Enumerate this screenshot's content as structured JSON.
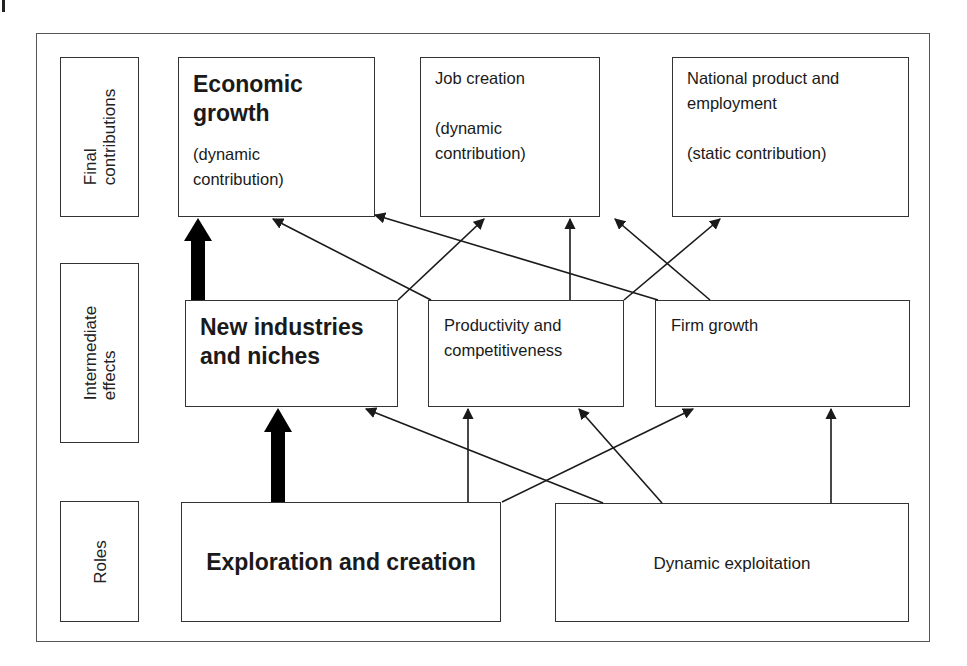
{
  "diagram": {
    "row_labels": {
      "final": [
        "Final",
        "contributions"
      ],
      "intermediate": [
        "Intermediate",
        "effects"
      ],
      "roles": [
        "Roles"
      ]
    },
    "final_contributions": {
      "economic_growth": {
        "title_line1": "Economic",
        "title_line2": "growth",
        "sub_line1": "(dynamic",
        "sub_line2": "contribution)"
      },
      "job_creation": {
        "title": "Job creation",
        "sub_line1": "(dynamic",
        "sub_line2": "contribution)"
      },
      "national_product": {
        "title_line1": "National product and",
        "title_line2": "employment",
        "sub": "(static contribution)"
      }
    },
    "intermediate_effects": {
      "new_industries": {
        "line1": "New industries",
        "line2": "and niches"
      },
      "productivity": {
        "line1": "Productivity and",
        "line2": "competitiveness"
      },
      "firm_growth": {
        "title": "Firm growth"
      }
    },
    "roles": {
      "exploration": {
        "title": "Exploration and creation"
      },
      "exploitation": {
        "title": "Dynamic exploitation"
      }
    },
    "edges": [
      {
        "from": "Exploration and creation",
        "to": "New industries and niches",
        "style": "thick"
      },
      {
        "from": "New industries and niches",
        "to": "Economic growth",
        "style": "thick"
      },
      {
        "from": "Exploration and creation",
        "to": "Productivity and competitiveness",
        "style": "thin"
      },
      {
        "from": "Exploration and creation",
        "to": "Firm growth",
        "style": "thin"
      },
      {
        "from": "Dynamic exploitation",
        "to": "New industries and niches",
        "style": "thin"
      },
      {
        "from": "Dynamic exploitation",
        "to": "Productivity and competitiveness",
        "style": "thin"
      },
      {
        "from": "Dynamic exploitation",
        "to": "Firm growth",
        "style": "thin"
      },
      {
        "from": "New industries and niches",
        "to": "Job creation",
        "style": "thin"
      },
      {
        "from": "Productivity and competitiveness",
        "to": "Economic growth",
        "style": "thin"
      },
      {
        "from": "Productivity and competitiveness",
        "to": "Job creation",
        "style": "thin"
      },
      {
        "from": "Productivity and competitiveness",
        "to": "National product and employment",
        "style": "thin"
      },
      {
        "from": "Firm growth",
        "to": "Economic growth",
        "style": "thin"
      },
      {
        "from": "Firm growth",
        "to": "Job creation",
        "style": "thin"
      }
    ],
    "colors": {
      "line": "#1a1a1a",
      "border": "#333333",
      "background": "#ffffff"
    }
  }
}
